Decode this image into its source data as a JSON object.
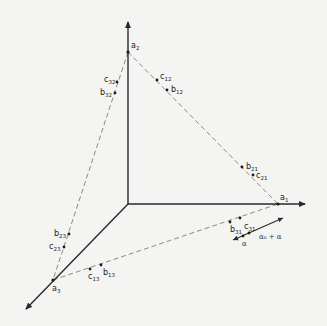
{
  "diagram": {
    "type": "simplex-in-3d-axes",
    "colors": {
      "background": "#f4f4f3",
      "axis": "#2a2a2a",
      "dashed_edge": "#8a8a8a",
      "point": "#1a1a1a",
      "label": "#222222"
    },
    "origin": [
      128,
      204
    ],
    "axes": [
      {
        "name": "axis-1",
        "to": [
          305,
          204
        ]
      },
      {
        "name": "axis-2",
        "to": [
          128,
          22
        ]
      },
      {
        "name": "axis-3",
        "to": [
          26,
          309
        ]
      }
    ],
    "vertices": [
      {
        "id": "a1",
        "base": "a",
        "sub": "1",
        "pos": [
          278,
          204
        ],
        "label_pos": [
          280,
          200
        ]
      },
      {
        "id": "a2",
        "base": "a",
        "sub": "2",
        "pos": [
          128,
          52
        ],
        "label_pos": [
          131,
          48
        ]
      },
      {
        "id": "a3",
        "base": "a",
        "sub": "3",
        "pos": [
          53,
          280
        ],
        "label_pos": [
          52,
          291
        ]
      }
    ],
    "edges": [
      {
        "from": [
          128,
          52
        ],
        "to": [
          278,
          204
        ]
      },
      {
        "from": [
          128,
          52
        ],
        "to": [
          53,
          280
        ]
      },
      {
        "from": [
          53,
          280
        ],
        "to": [
          278,
          204
        ]
      }
    ],
    "points": [
      {
        "id": "c12",
        "base": "c",
        "sub": "12",
        "pos": [
          157,
          80
        ],
        "label_pos": [
          160,
          79
        ]
      },
      {
        "id": "b12",
        "base": "b",
        "sub": "12",
        "pos": [
          167,
          90
        ],
        "label_pos": [
          171,
          92
        ]
      },
      {
        "id": "b21",
        "base": "b",
        "sub": "21",
        "pos": [
          242,
          167
        ],
        "label_pos": [
          246,
          169
        ]
      },
      {
        "id": "c21",
        "base": "c",
        "sub": "21",
        "pos": [
          253,
          175
        ],
        "label_pos": [
          256,
          178
        ]
      },
      {
        "id": "c32",
        "base": "c",
        "sub": "32",
        "pos": [
          117,
          82
        ],
        "label_pos": [
          104,
          82
        ]
      },
      {
        "id": "b32",
        "base": "b",
        "sub": "32",
        "pos": [
          115,
          93
        ],
        "label_pos": [
          100,
          95
        ]
      },
      {
        "id": "b23",
        "base": "b",
        "sub": "23",
        "pos": [
          69,
          234
        ],
        "label_pos": [
          54,
          236
        ]
      },
      {
        "id": "c23",
        "base": "c",
        "sub": "23",
        "pos": [
          64,
          247
        ],
        "label_pos": [
          49,
          249
        ]
      },
      {
        "id": "c13",
        "base": "c",
        "sub": "13",
        "pos": [
          90,
          269
        ],
        "label_pos": [
          88,
          279
        ]
      },
      {
        "id": "b13",
        "base": "b",
        "sub": "13",
        "pos": [
          101,
          265
        ],
        "label_pos": [
          103,
          275
        ]
      },
      {
        "id": "b31",
        "base": "b",
        "sub": "31",
        "pos": [
          230,
          222
        ],
        "label_pos": [
          230,
          232
        ]
      },
      {
        "id": "c31",
        "base": "c",
        "sub": "31",
        "pos": [
          240,
          218
        ],
        "label_pos": [
          244,
          229
        ]
      }
    ],
    "step_arrow": {
      "from": [
        233,
        240
      ],
      "to": [
        283,
        218
      ],
      "dots": [
        [
          243,
          236
        ],
        [
          249,
          233
        ]
      ],
      "label_alpha0_alpha": "α₀ + α",
      "label_alpha0_alpha_pos": [
        259,
        239
      ],
      "label_alpha": "α",
      "label_alpha_pos": [
        242,
        246
      ]
    }
  }
}
